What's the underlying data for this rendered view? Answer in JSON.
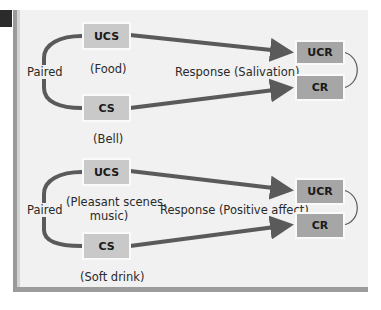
{
  "colors": {
    "panel_bg": "#f1f1f1",
    "stimulus_box": "#c9c9c9",
    "response_box": "#a6a6a6",
    "arrow": "#5a5a5a",
    "tab": "#2b2b2b"
  },
  "diagrams": [
    {
      "paired_label": "Paired",
      "ucs": {
        "label": "UCS",
        "caption": "(Food)"
      },
      "cs": {
        "label": "CS",
        "caption": "(Bell)"
      },
      "response_label": "Response (Salivation)",
      "ucr": {
        "label": "UCR"
      },
      "cr": {
        "label": "CR"
      }
    },
    {
      "paired_label": "Paired",
      "ucs": {
        "label": "UCS",
        "caption_line1": "(Pleasant scenes,",
        "caption_line2": "music)"
      },
      "cs": {
        "label": "CS",
        "caption": "(Soft drink)"
      },
      "response_label": "Response (Positive affect)",
      "ucr": {
        "label": "UCR"
      },
      "cr": {
        "label": "CR"
      }
    }
  ]
}
